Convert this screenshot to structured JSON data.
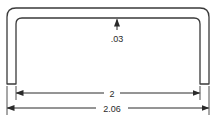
{
  "diagram": {
    "type": "dimensioned-technical-drawing",
    "dimensions": {
      "thickness": {
        "label": ".03",
        "value": 0.03
      },
      "inner_width": {
        "label": "2",
        "value": 2
      },
      "outer_width": {
        "label": "2.06",
        "value": 2.06
      }
    },
    "colors": {
      "line": "#3a3a3a",
      "background": "#ffffff"
    }
  }
}
